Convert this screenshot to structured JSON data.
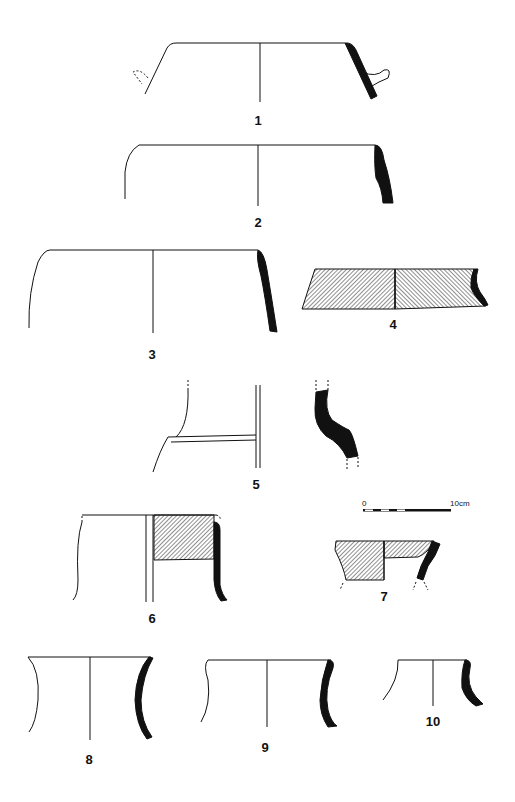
{
  "plate": {
    "type": "archaeological pottery profile drawings",
    "background": "#ffffff",
    "ink": "#111111"
  },
  "scale_bar": {
    "start_label": "0",
    "end_label": "10cm"
  },
  "figures": [
    {
      "number": "1",
      "label": "1",
      "form": "carinated rim with lug handle"
    },
    {
      "number": "2",
      "label": "2",
      "form": "rounded rim, thick wall"
    },
    {
      "number": "3",
      "label": "3",
      "form": "wide bowl rim"
    },
    {
      "number": "4",
      "label": "4",
      "form": "hatched (slipped) rim section"
    },
    {
      "number": "5",
      "label": "5",
      "form": "pedestal / flanged base"
    },
    {
      "number": "6",
      "label": "6",
      "form": "straight-sided vessel, partly hatched"
    },
    {
      "number": "7",
      "label": "7",
      "form": "small hatched bowl"
    },
    {
      "number": "8",
      "label": "8",
      "form": "concave-sided vessel"
    },
    {
      "number": "9",
      "label": "9",
      "form": "concave-sided vessel"
    },
    {
      "number": "10",
      "label": "10",
      "form": "small flaring-neck vessel"
    }
  ]
}
